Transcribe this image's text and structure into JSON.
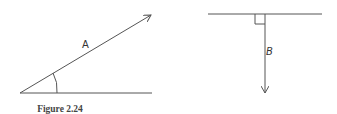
{
  "figure": {
    "caption": "Figure 2.24",
    "stroke_color": "#555555",
    "left_diagram": {
      "vector_label": "A",
      "description": "Vector A at an acute angle above a horizontal reference line, angle marked with an arc"
    },
    "right_diagram": {
      "vector_label": "B",
      "description": "Vector B pointing straight down, perpendicular to a horizontal reference line, right angle marked with a square"
    }
  }
}
